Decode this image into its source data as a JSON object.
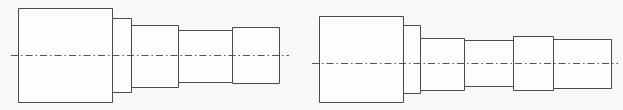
{
  "document": {
    "title": "Stepped Shaft Orthographic Views",
    "description": "Two side-by-side line drawings of stepped cylindrical shafts shown in front elevation, each with a horizontal dash-dot axis centerline.",
    "background_color": "#f8f8f6",
    "line_color": "#4a4a4a",
    "centerline_color": "#555555",
    "fill_color": "#fdfdfc",
    "stroke_width": 1,
    "view_type": "front-elevation",
    "units": "pixels"
  },
  "figures": [
    {
      "id": "figure-left",
      "name": "left-stepped-shaft",
      "label": "",
      "step_count": 5,
      "centerline": {
        "y": 55,
        "x_start": 11,
        "x_end": 289
      },
      "steps": [
        {
          "name": "step-1-flange",
          "x": 18,
          "y": 8,
          "width": 94,
          "height": 94
        },
        {
          "name": "step-2-collar",
          "x": 112,
          "y": 18,
          "width": 19,
          "height": 74
        },
        {
          "name": "step-3-journal",
          "x": 131,
          "y": 25,
          "width": 47,
          "height": 62
        },
        {
          "name": "step-4-shaft",
          "x": 178,
          "y": 30,
          "width": 54,
          "height": 52
        },
        {
          "name": "step-5-end",
          "x": 232,
          "y": 27,
          "width": 47,
          "height": 56
        }
      ]
    },
    {
      "id": "figure-right",
      "name": "right-stepped-shaft",
      "label": "",
      "step_count": 6,
      "centerline": {
        "y": 63,
        "x_start": 312,
        "x_end": 618
      },
      "steps": [
        {
          "name": "step-1-flange",
          "x": 319,
          "y": 16,
          "width": 84,
          "height": 86
        },
        {
          "name": "step-2-collar",
          "x": 403,
          "y": 25,
          "width": 17,
          "height": 68
        },
        {
          "name": "step-3-journal",
          "x": 420,
          "y": 38,
          "width": 44,
          "height": 52
        },
        {
          "name": "step-4-shaft",
          "x": 464,
          "y": 40,
          "width": 49,
          "height": 46
        },
        {
          "name": "step-5-collar",
          "x": 513,
          "y": 36,
          "width": 40,
          "height": 54
        },
        {
          "name": "step-6-end",
          "x": 553,
          "y": 39,
          "width": 58,
          "height": 49
        }
      ]
    }
  ]
}
